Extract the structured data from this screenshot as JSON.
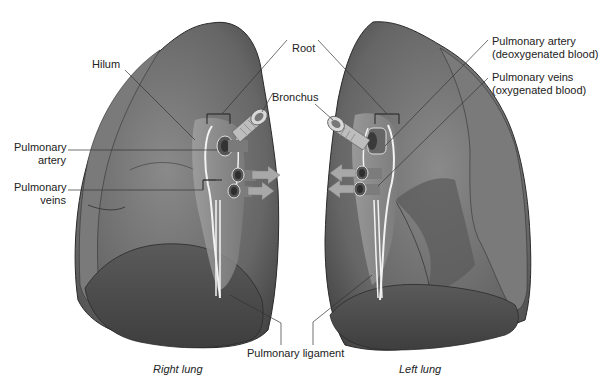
{
  "figure": {
    "labels": {
      "hilum": "Hilum",
      "root": "Root",
      "bronchus": "Bronchus",
      "right_pulmonary_artery": [
        "Pulmonary",
        "artery"
      ],
      "right_pulmonary_veins": [
        "Pulmonary",
        "veins"
      ],
      "left_pulmonary_artery": [
        "Pulmonary artery",
        "(deoxygenated blood)"
      ],
      "left_pulmonary_veins": [
        "Pulmonary veins",
        "(oxygenated blood)"
      ],
      "pulmonary_ligament": "Pulmonary ligament"
    },
    "captions": {
      "right_lung": "Right lung",
      "left_lung": "Left lung"
    },
    "colors": {
      "lung_fill": "#6e6e6e",
      "lung_dark": "#4a4a4a",
      "lung_light": "#9a9a9a",
      "outline": "#2a2a2a",
      "vessel": "#8c8c8c",
      "arrow": "#a8a8a8",
      "leader": "#333333"
    }
  }
}
